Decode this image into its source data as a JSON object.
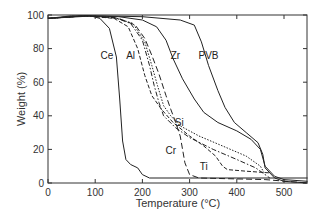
{
  "chart_data": {
    "type": "line",
    "title": "",
    "xlabel": "Temperature (°C)",
    "ylabel": "Weight (%)",
    "xlim": [
      0,
      550
    ],
    "ylim": [
      0,
      100
    ],
    "xticks": [
      0,
      100,
      200,
      300,
      400,
      500
    ],
    "yticks": [
      0,
      20,
      40,
      60,
      80,
      100
    ],
    "xtick_labels": [
      "0",
      "100",
      "200",
      "300",
      "400",
      "500"
    ],
    "ytick_labels": [
      "0",
      "20",
      "40",
      "60",
      "80",
      "100"
    ],
    "grid": false,
    "legend": "none (inline curve labels)",
    "series": [
      {
        "name": "Ce",
        "style": "solid",
        "label_at": [
          125,
          74
        ],
        "points": [
          [
            0,
            98
          ],
          [
            50,
            99.5
          ],
          [
            90,
            99.5
          ],
          [
            110,
            98
          ],
          [
            130,
            92
          ],
          [
            145,
            75
          ],
          [
            152,
            50
          ],
          [
            158,
            25
          ],
          [
            165,
            14
          ],
          [
            175,
            11
          ],
          [
            190,
            9
          ],
          [
            200,
            5
          ],
          [
            215,
            3
          ],
          [
            300,
            3
          ],
          [
            550,
            3
          ]
        ]
      },
      {
        "name": "Al",
        "style": "dash-dot",
        "label_at": [
          175,
          74
        ],
        "points": [
          [
            0,
            98
          ],
          [
            80,
            99.5
          ],
          [
            140,
            98.5
          ],
          [
            175,
            95
          ],
          [
            200,
            85
          ],
          [
            215,
            70
          ],
          [
            225,
            58
          ],
          [
            235,
            48
          ],
          [
            245,
            40
          ],
          [
            270,
            33
          ],
          [
            300,
            27
          ],
          [
            350,
            20
          ],
          [
            400,
            14
          ],
          [
            440,
            9
          ],
          [
            460,
            5
          ],
          [
            470,
            3
          ]
        ]
      },
      {
        "name": "Si",
        "style": "dotted",
        "label_at": [
          278,
          34
        ],
        "points": [
          [
            0,
            98
          ],
          [
            80,
            99.5
          ],
          [
            140,
            98.5
          ],
          [
            180,
            95
          ],
          [
            205,
            84
          ],
          [
            220,
            70
          ],
          [
            232,
            58
          ],
          [
            245,
            46
          ],
          [
            260,
            40
          ],
          [
            280,
            34
          ],
          [
            320,
            28
          ],
          [
            370,
            22
          ],
          [
            420,
            16
          ],
          [
            450,
            10
          ],
          [
            460,
            5
          ]
        ]
      },
      {
        "name": "Ti",
        "style": "dashed",
        "label_at": [
          330,
          8
        ],
        "points": [
          [
            0,
            98
          ],
          [
            80,
            99.5
          ],
          [
            140,
            98
          ],
          [
            170,
            93
          ],
          [
            190,
            80
          ],
          [
            205,
            64
          ],
          [
            220,
            52
          ],
          [
            240,
            44
          ],
          [
            265,
            36
          ],
          [
            300,
            28
          ],
          [
            330,
            22
          ],
          [
            355,
            16
          ],
          [
            370,
            10
          ],
          [
            380,
            8
          ],
          [
            420,
            7
          ],
          [
            470,
            6
          ]
        ]
      },
      {
        "name": "Cr",
        "style": "long-dash",
        "label_at": [
          260,
          17
        ],
        "points": [
          [
            0,
            98
          ],
          [
            80,
            99.5
          ],
          [
            150,
            98
          ],
          [
            185,
            94
          ],
          [
            205,
            86
          ],
          [
            220,
            76
          ],
          [
            235,
            65
          ],
          [
            250,
            52
          ],
          [
            260,
            44
          ],
          [
            268,
            38
          ],
          [
            280,
            28
          ],
          [
            290,
            12
          ],
          [
            300,
            5
          ],
          [
            320,
            3
          ],
          [
            460,
            2
          ],
          [
            550,
            0
          ]
        ]
      },
      {
        "name": "Zr",
        "style": "solid",
        "label_at": [
          270,
          74
        ],
        "points": [
          [
            0,
            98
          ],
          [
            80,
            99.5
          ],
          [
            150,
            99
          ],
          [
            200,
            97
          ],
          [
            230,
            93
          ],
          [
            250,
            85
          ],
          [
            265,
            74
          ],
          [
            285,
            62
          ],
          [
            310,
            50
          ],
          [
            330,
            42
          ],
          [
            360,
            36
          ],
          [
            400,
            31
          ],
          [
            430,
            26
          ],
          [
            450,
            20
          ],
          [
            460,
            10
          ],
          [
            480,
            4
          ],
          [
            500,
            2
          ],
          [
            550,
            1
          ]
        ]
      },
      {
        "name": "PVB",
        "style": "solid",
        "label_at": [
          340,
          74
        ],
        "points": [
          [
            0,
            98
          ],
          [
            100,
            99.5
          ],
          [
            200,
            99
          ],
          [
            280,
            97
          ],
          [
            310,
            94
          ],
          [
            325,
            84
          ],
          [
            340,
            70
          ],
          [
            360,
            55
          ],
          [
            375,
            45
          ],
          [
            395,
            36
          ],
          [
            420,
            30
          ],
          [
            445,
            24
          ],
          [
            455,
            17
          ],
          [
            460,
            9
          ],
          [
            480,
            3
          ],
          [
            500,
            1
          ],
          [
            550,
            0
          ]
        ]
      }
    ]
  }
}
